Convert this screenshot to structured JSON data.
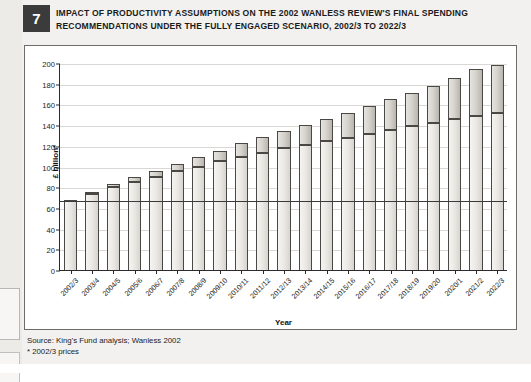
{
  "figure": {
    "number": "7",
    "title": "IMPACT OF PRODUCTIVITY ASSUMPTIONS ON THE 2002 WANLESS REVIEW'S FINAL SPENDING RECOMMENDATIONS UNDER THE FULLY ENGAGED SCENARIO, 2002/3 TO 2022/3"
  },
  "footer": {
    "source": "Source: King's Fund analysis; Wanless 2002",
    "note": "* 2002/3 prices"
  },
  "chart_data": {
    "type": "bar",
    "title": "IMPACT OF PRODUCTIVITY ASSUMPTIONS ON THE 2002 WANLESS REVIEW'S FINAL SPENDING RECOMMENDATIONS UNDER THE FULLY ENGAGED SCENARIO, 2002/3 TO 2022/3",
    "xlabel": "Year",
    "ylabel": "£ billion*",
    "ylim": [
      0,
      200
    ],
    "yticks": [
      0,
      20,
      40,
      60,
      80,
      100,
      120,
      140,
      160,
      180,
      200
    ],
    "grid": true,
    "legend": "none",
    "stacked": true,
    "reference_line": {
      "value": 68,
      "label": "2002/3 baseline spending"
    },
    "categories": [
      "2002/3",
      "2003/4",
      "2004/5",
      "2005/6",
      "2006/7",
      "2007/8",
      "2008/9",
      "2009/10",
      "2010/11",
      "2011/12",
      "2012/13",
      "2013/14",
      "2014/15",
      "2015/16",
      "2016/17",
      "2017/18",
      "2018/19",
      "2019/20",
      "2020/1",
      "2021/2",
      "2022/3"
    ],
    "series": [
      {
        "name": "Base spending (lower productivity segment)",
        "values": [
          68,
          73,
          80,
          85,
          90,
          96,
          100,
          105,
          109,
          113,
          118,
          121,
          125,
          128,
          131,
          135,
          139,
          142,
          146,
          149,
          152
        ]
      },
      {
        "name": "Additional spending from productivity assumptions",
        "values": [
          0,
          2.5,
          3,
          5,
          6,
          6.5,
          9,
          10,
          13.5,
          15.5,
          16,
          19,
          21,
          24,
          27,
          30,
          32,
          36,
          40,
          45,
          46
        ]
      }
    ],
    "totals": [
      68,
      75.5,
      83,
      90,
      96,
      102.5,
      109,
      115,
      122.5,
      128.5,
      134,
      140,
      146,
      152,
      158,
      165,
      171,
      178,
      186,
      194,
      198
    ]
  }
}
